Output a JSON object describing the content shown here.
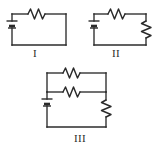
{
  "figure": {
    "kind": "physics-circuit-diagram",
    "background_color": "#ffffff",
    "stroke_color": "#2b2b2b",
    "width": 164,
    "height": 152,
    "circuits": [
      {
        "id": "circuit-1",
        "label": "I",
        "components": [
          "battery",
          "resistor"
        ],
        "topology": "single loop: battery in series with one resistor",
        "resistor_count": 1,
        "battery_count": 1
      },
      {
        "id": "circuit-2",
        "label": "II",
        "components": [
          "battery",
          "resistor",
          "resistor"
        ],
        "topology": "single loop: battery in series with two resistors",
        "resistor_count": 2,
        "battery_count": 1
      },
      {
        "id": "circuit-3",
        "label": "III",
        "components": [
          "battery",
          "resistor",
          "resistor",
          "resistor"
        ],
        "topology": "battery in series with a vertical resistor and two parallel resistors",
        "resistor_count": 3,
        "battery_count": 1
      }
    ]
  }
}
